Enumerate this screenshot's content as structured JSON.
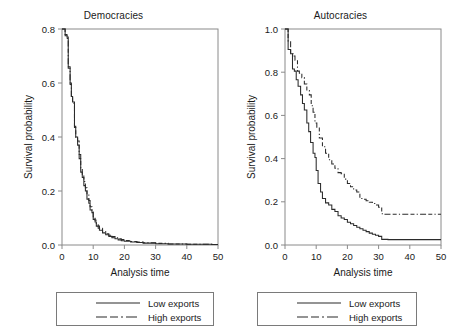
{
  "figure": {
    "background": "#ffffff",
    "line_color": "#2b2b2b",
    "frame_color": "#8a8a8a"
  },
  "panels": [
    {
      "id": "democracies",
      "title": "Democracies",
      "xlabel": "Analysis time",
      "ylabel": "Survival probability",
      "xticks": [
        "0",
        "10",
        "20",
        "30",
        "40",
        "50"
      ],
      "yticks": [
        "0.0",
        "0.2",
        "0.4",
        "0.6",
        "0.8"
      ],
      "legend": {
        "low_label": "Low exports",
        "high_label": "High exports"
      }
    },
    {
      "id": "autocracies",
      "title": "Autocracies",
      "xlabel": "Analysis time",
      "ylabel": "Survival probability",
      "xticks": [
        "0",
        "10",
        "20",
        "30",
        "40",
        "50"
      ],
      "yticks": [
        "0.0",
        "0.2",
        "0.4",
        "0.6",
        "0.8",
        "1.0"
      ],
      "legend": {
        "low_label": "Low exports",
        "high_label": "High exports"
      }
    }
  ],
  "chart_data": [
    {
      "type": "line",
      "subplot": "left",
      "title": "Democracies",
      "xlabel": "Analysis time",
      "ylabel": "Survival probability",
      "xlim": [
        0,
        50
      ],
      "ylim": [
        0.0,
        0.8
      ],
      "xticks": [
        0,
        10,
        20,
        30,
        40,
        50
      ],
      "yticks": [
        0.0,
        0.2,
        0.4,
        0.6,
        0.8
      ],
      "grid": false,
      "legend_position": "below",
      "step_style": "post",
      "series": [
        {
          "name": "Low exports",
          "style": "solid",
          "x": [
            0,
            1,
            1.6,
            2,
            2.6,
            3,
            3.4,
            4,
            4.4,
            5,
            5.5,
            6,
            6.5,
            7,
            7.5,
            8,
            8.6,
            9,
            9.6,
            10,
            10.6,
            11,
            11.6,
            12,
            13,
            14,
            15,
            16,
            17,
            18,
            19,
            20,
            22,
            24,
            26,
            30,
            34,
            40,
            48
          ],
          "y": [
            0.8,
            0.78,
            0.77,
            0.66,
            0.6,
            0.55,
            0.53,
            0.44,
            0.4,
            0.37,
            0.32,
            0.27,
            0.25,
            0.22,
            0.2,
            0.17,
            0.155,
            0.13,
            0.12,
            0.095,
            0.085,
            0.07,
            0.062,
            0.055,
            0.045,
            0.038,
            0.032,
            0.027,
            0.023,
            0.019,
            0.016,
            0.014,
            0.011,
            0.009,
            0.007,
            0.005,
            0.004,
            0.003,
            0.002
          ]
        },
        {
          "name": "High exports",
          "style": "dash-dot",
          "x": [
            0,
            1,
            1.6,
            2,
            2.6,
            3,
            3.4,
            4,
            4.4,
            5,
            5.5,
            6,
            6.5,
            7,
            7.5,
            8,
            8.6,
            9,
            9.6,
            10,
            10.6,
            11,
            11.6,
            12,
            13,
            14,
            15,
            16,
            17,
            18,
            19,
            20,
            22,
            24,
            26,
            30,
            34,
            40,
            48
          ],
          "y": [
            0.8,
            0.775,
            0.765,
            0.655,
            0.595,
            0.545,
            0.525,
            0.435,
            0.395,
            0.385,
            0.335,
            0.285,
            0.262,
            0.235,
            0.212,
            0.185,
            0.165,
            0.142,
            0.128,
            0.105,
            0.092,
            0.078,
            0.07,
            0.062,
            0.05,
            0.042,
            0.036,
            0.031,
            0.027,
            0.023,
            0.02,
            0.017,
            0.013,
            0.011,
            0.008,
            0.006,
            0.004,
            0.003,
            0.002
          ]
        }
      ]
    },
    {
      "type": "line",
      "subplot": "right",
      "title": "Autocracies",
      "xlabel": "Analysis time",
      "ylabel": "Survival probability",
      "xlim": [
        0,
        50
      ],
      "ylim": [
        0.0,
        1.0
      ],
      "xticks": [
        0,
        10,
        20,
        30,
        40,
        50
      ],
      "yticks": [
        0.0,
        0.2,
        0.4,
        0.6,
        0.8,
        1.0
      ],
      "grid": false,
      "legend_position": "below",
      "step_style": "post",
      "series": [
        {
          "name": "Low exports",
          "style": "solid",
          "x": [
            0,
            1,
            1.8,
            2.4,
            3,
            3.6,
            4.2,
            5,
            5.6,
            6.2,
            7,
            7.6,
            8.2,
            9,
            9.6,
            10,
            10.6,
            11.4,
            12,
            13,
            14,
            15,
            16,
            17,
            18,
            19,
            20,
            21,
            22,
            23,
            24,
            25,
            26,
            27,
            28,
            29,
            30,
            31,
            33,
            36,
            40,
            44,
            48
          ],
          "y": [
            1.0,
            0.905,
            0.885,
            0.815,
            0.805,
            0.765,
            0.735,
            0.695,
            0.655,
            0.625,
            0.565,
            0.525,
            0.475,
            0.425,
            0.405,
            0.345,
            0.285,
            0.245,
            0.215,
            0.195,
            0.185,
            0.165,
            0.155,
            0.135,
            0.125,
            0.118,
            0.105,
            0.098,
            0.09,
            0.082,
            0.075,
            0.068,
            0.062,
            0.055,
            0.05,
            0.045,
            0.04,
            0.026,
            0.025,
            0.025,
            0.025,
            0.025,
            0.025
          ]
        },
        {
          "name": "High exports",
          "style": "dash-dot",
          "x": [
            0,
            1,
            1.8,
            2.6,
            3.2,
            4,
            4.6,
            5.4,
            6.2,
            7,
            7.8,
            8.4,
            9,
            9.6,
            10.2,
            11,
            12,
            13,
            14,
            15,
            16,
            17,
            18,
            19,
            20,
            21,
            22,
            23,
            24,
            25,
            26,
            27,
            28,
            29,
            30,
            31,
            31.6,
            34,
            38,
            42,
            46,
            48
          ],
          "y": [
            1.0,
            0.945,
            0.885,
            0.875,
            0.855,
            0.805,
            0.795,
            0.775,
            0.745,
            0.715,
            0.695,
            0.645,
            0.615,
            0.565,
            0.545,
            0.495,
            0.455,
            0.425,
            0.395,
            0.375,
            0.355,
            0.335,
            0.33,
            0.305,
            0.285,
            0.27,
            0.255,
            0.245,
            0.215,
            0.212,
            0.205,
            0.198,
            0.192,
            0.185,
            0.175,
            0.145,
            0.142,
            0.142,
            0.142,
            0.142,
            0.142,
            0.142
          ]
        }
      ]
    }
  ]
}
